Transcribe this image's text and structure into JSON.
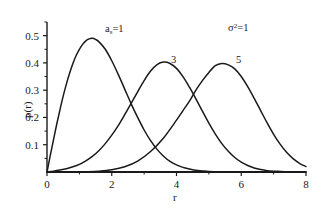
{
  "chart_data": {
    "type": "line",
    "title": "",
    "subtitle": "",
    "xlabel": "r",
    "ylabel": "p(r)",
    "xlim": [
      0,
      8
    ],
    "ylim": [
      0,
      0.55
    ],
    "grid": false,
    "legend_position": "inline-curve-labels",
    "xticks": [
      "0",
      "2",
      "4",
      "6",
      "8"
    ],
    "xtick_values": [
      0,
      2,
      4,
      6,
      8
    ],
    "yticks": [
      "0.1",
      "0.2",
      "0.3",
      "0.4",
      "0.5"
    ],
    "ytick_values": [
      0.1,
      0.2,
      0.3,
      0.4,
      0.5
    ],
    "annotations": [
      {
        "text_html": "a<sub>s</sub>=1",
        "text": "as=1",
        "x": 2.05,
        "y": 0.455
      },
      {
        "text_html": "&#963;<sup>2</sup>=1",
        "text": "σ²=1",
        "x": 5.95,
        "y": 0.49
      }
    ],
    "series": [
      {
        "name": "3",
        "label": "3",
        "color": "#1a1a1a",
        "peak_x": 3.16,
        "peak_y": 0.403,
        "x": [
          0,
          0.2,
          0.4,
          0.6,
          0.8,
          1.0,
          1.2,
          1.4,
          1.6,
          1.8,
          2.0,
          2.2,
          2.4,
          2.6,
          2.8,
          3.0,
          3.2,
          3.4,
          3.6,
          3.8,
          4.0,
          4.2,
          4.4,
          4.6,
          4.8,
          5.0,
          5.2,
          5.4,
          5.6,
          5.8,
          6.0,
          6.2,
          6.4,
          6.6,
          6.8,
          7.0,
          7.2,
          7.4,
          7.6,
          7.8,
          8.0
        ],
        "y": [
          0.0,
          0.003,
          0.007,
          0.012,
          0.019,
          0.028,
          0.041,
          0.057,
          0.078,
          0.104,
          0.135,
          0.17,
          0.21,
          0.252,
          0.294,
          0.335,
          0.37,
          0.394,
          0.403,
          0.398,
          0.38,
          0.35,
          0.311,
          0.268,
          0.223,
          0.179,
          0.139,
          0.104,
          0.076,
          0.053,
          0.036,
          0.024,
          0.015,
          0.009,
          0.005,
          0.003,
          0.002,
          0.001,
          0.0005,
          0.0002,
          0.0001
        ]
      },
      {
        "name": "5",
        "label": "5",
        "color": "#1a1a1a",
        "peak_x": 5.12,
        "peak_y": 0.398,
        "x": [
          0,
          0.4,
          0.8,
          1.2,
          1.6,
          2.0,
          2.4,
          2.8,
          3.2,
          3.6,
          4.0,
          4.2,
          4.4,
          4.6,
          4.8,
          5.0,
          5.2,
          5.4,
          5.6,
          5.8,
          6.0,
          6.2,
          6.4,
          6.6,
          6.8,
          7.0,
          7.2,
          7.4,
          7.6,
          7.8,
          8.0
        ],
        "y": [
          0.0,
          0.0,
          0.0,
          0.001,
          0.003,
          0.008,
          0.019,
          0.04,
          0.075,
          0.125,
          0.19,
          0.225,
          0.26,
          0.3,
          0.335,
          0.365,
          0.39,
          0.398,
          0.393,
          0.378,
          0.35,
          0.313,
          0.27,
          0.225,
          0.18,
          0.138,
          0.102,
          0.072,
          0.049,
          0.032,
          0.02
        ]
      },
      {
        "name": "1",
        "label": "a_s=1",
        "color": "#1a1a1a",
        "peak_x": 1.32,
        "peak_y": 0.49,
        "x": [
          0,
          0.1,
          0.2,
          0.3,
          0.4,
          0.5,
          0.6,
          0.7,
          0.8,
          0.9,
          1.0,
          1.1,
          1.2,
          1.3,
          1.4,
          1.5,
          1.6,
          1.8,
          2.0,
          2.2,
          2.4,
          2.6,
          2.8,
          3.0,
          3.2,
          3.4,
          3.6,
          3.8,
          4.0,
          4.2,
          4.4,
          4.6,
          4.8,
          5.0,
          5.4,
          5.8,
          6.2,
          6.6,
          7.0,
          7.4,
          7.8,
          8.0
        ],
        "y": [
          0.0,
          0.06,
          0.118,
          0.175,
          0.228,
          0.278,
          0.323,
          0.363,
          0.398,
          0.427,
          0.45,
          0.468,
          0.481,
          0.488,
          0.49,
          0.486,
          0.478,
          0.45,
          0.408,
          0.358,
          0.304,
          0.25,
          0.2,
          0.154,
          0.115,
          0.083,
          0.058,
          0.039,
          0.026,
          0.017,
          0.011,
          0.006,
          0.004,
          0.002,
          0.0007,
          0.0002,
          0.0001,
          0.0,
          0.0,
          0.0,
          0.0,
          0.0
        ]
      }
    ],
    "curve_labels": [
      {
        "label": "a_s=1",
        "html": "a<sub>s</sub>=1"
      },
      {
        "label": "3",
        "html": "3"
      },
      {
        "label": "5",
        "html": "5"
      }
    ]
  },
  "axes": {
    "x_title": "r",
    "y_title": "p(r)"
  },
  "labels": {
    "curve1_html": "a<sub>s</sub>=1",
    "curve2": "3",
    "curve3": "5",
    "sigma_html": "&#963;<sup>2</sup>=1"
  },
  "colors": {
    "curve": "#1a1a1a",
    "axis": "#1a1a1a",
    "background": "#ffffff"
  }
}
